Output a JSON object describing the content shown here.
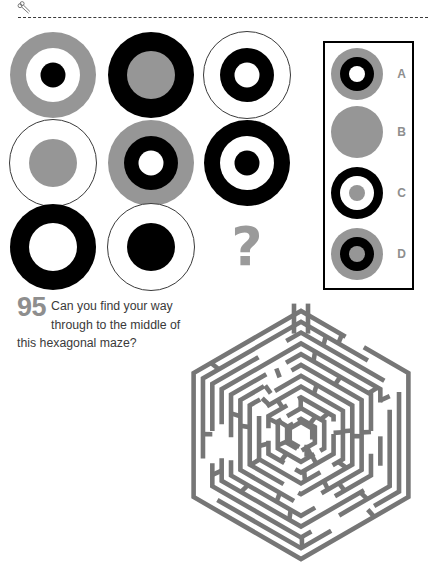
{
  "page": {
    "cut_line": "dashed-cut-line",
    "scissors_icon": "scissors-icon"
  },
  "colors": {
    "gray": "#969696",
    "black": "#000000",
    "white": "#ffffff",
    "outline": "#3a3a3a",
    "maze_wall": "#767676",
    "label_gray": "#8e8e8e",
    "text": "#3a3a3a"
  },
  "matrix_puzzle": {
    "name": "circle-matrix-puzzle",
    "missing_cell_marker": "?",
    "cells": [
      {
        "id": "cell-1",
        "row": 0,
        "col": 0,
        "outer": "gray",
        "middle": "white",
        "inner": "black",
        "outlined": false,
        "rings": 3
      },
      {
        "id": "cell-2",
        "row": 0,
        "col": 1,
        "outer": "black",
        "middle": "gray",
        "inner": "none",
        "outlined": false,
        "rings": 2
      },
      {
        "id": "cell-3",
        "row": 0,
        "col": 2,
        "outer": "white",
        "middle": "black",
        "inner": "white",
        "outlined": true,
        "rings": 3
      },
      {
        "id": "cell-4",
        "row": 1,
        "col": 0,
        "outer": "white",
        "middle": "gray",
        "inner": "none",
        "outlined": true,
        "rings": 2
      },
      {
        "id": "cell-5",
        "row": 1,
        "col": 1,
        "outer": "gray",
        "middle": "black",
        "inner": "white",
        "outlined": false,
        "rings": 3
      },
      {
        "id": "cell-6",
        "row": 1,
        "col": 2,
        "outer": "black",
        "middle": "white",
        "inner": "black",
        "outlined": false,
        "rings": 3
      },
      {
        "id": "cell-7",
        "row": 2,
        "col": 0,
        "outer": "black",
        "middle": "white",
        "inner": "none",
        "outlined": false,
        "rings": 2
      },
      {
        "id": "cell-8",
        "row": 2,
        "col": 1,
        "outer": "white",
        "middle": "black",
        "inner": "none",
        "outlined": true,
        "rings": 2
      },
      {
        "id": "cell-9",
        "row": 2,
        "col": 2,
        "outer": "none",
        "middle": "none",
        "inner": "none",
        "outlined": false,
        "rings": 0
      }
    ]
  },
  "answer_options": {
    "name": "answer-options-box",
    "items": [
      {
        "label": "A",
        "outer": "gray",
        "middle": "black",
        "inner": "white",
        "rings": 3
      },
      {
        "label": "B",
        "outer": "gray",
        "middle": "none",
        "inner": "none",
        "rings": 1
      },
      {
        "label": "C",
        "outer": "black",
        "middle": "white",
        "inner": "gray",
        "rings": 3
      },
      {
        "label": "D",
        "outer": "gray",
        "middle": "black",
        "inner": "gray",
        "rings": 3
      }
    ]
  },
  "question": {
    "number": "95",
    "text": "Can you find your way through to the middle of this hexagonal maze?"
  },
  "maze": {
    "name": "hexagonal-maze",
    "shape": "hexagon",
    "rings": 11,
    "entrance": "top",
    "goal": "center-hexagon"
  }
}
